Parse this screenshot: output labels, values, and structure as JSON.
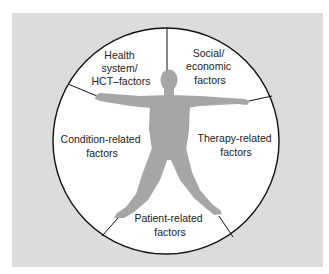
{
  "diagram": {
    "colors": {
      "background_panel": "#dcdcdc",
      "circle_fill": "#ffffff",
      "circle_stroke": "#111111",
      "figure": "#a6a6a6",
      "text": "#222222"
    },
    "segments": [
      {
        "id": "health-system",
        "lines": [
          "Health",
          "system/",
          "HCT–factors"
        ]
      },
      {
        "id": "social-economic",
        "lines": [
          "Social/",
          "economic",
          "factors"
        ]
      },
      {
        "id": "therapy-related",
        "lines": [
          "Therapy-related",
          "factors"
        ]
      },
      {
        "id": "patient-related",
        "lines": [
          "Patient-related",
          "factors"
        ]
      },
      {
        "id": "condition-related",
        "lines": [
          "Condition-related",
          "factors"
        ]
      }
    ],
    "center_figure": "human-figure-silhouette"
  }
}
